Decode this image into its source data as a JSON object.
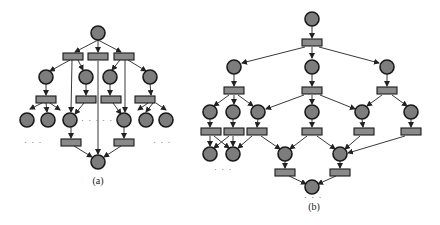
{
  "figure": {
    "subfigures": [
      {
        "id": "a",
        "caption": "(a)"
      },
      {
        "id": "b",
        "caption": "(b)"
      }
    ],
    "ellipsis": "· · ·",
    "colors": {
      "place_fill": "#7d7d7d",
      "transition_fill": "#8a8a8a",
      "stroke": "#1a1a1a"
    }
  }
}
